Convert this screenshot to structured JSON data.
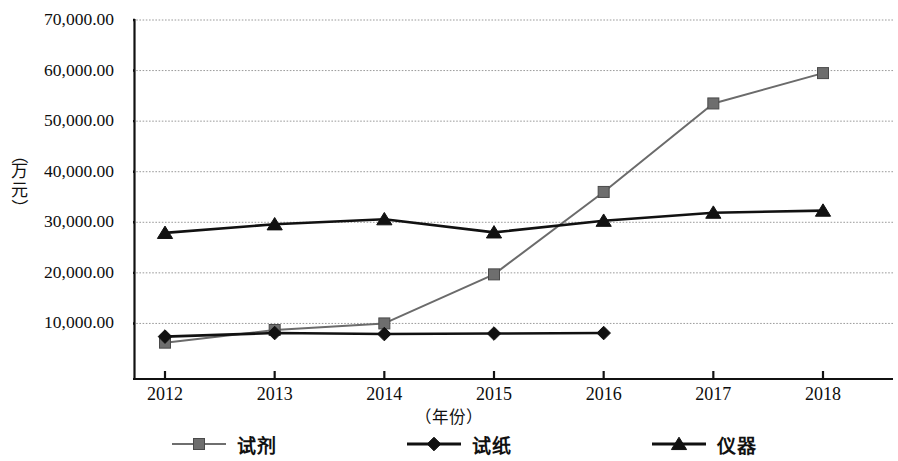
{
  "chart_data": {
    "type": "line",
    "title": "",
    "xlabel": "（年份）",
    "ylabel": "（万元）",
    "x": [
      "2012",
      "2013",
      "2014",
      "2015",
      "2016",
      "2017",
      "2018"
    ],
    "categories": [
      "2012",
      "2013",
      "2014",
      "2015",
      "2016",
      "2017",
      "2018"
    ],
    "ylim": [
      0,
      70000
    ],
    "xlim": [
      "2012",
      "2018"
    ],
    "grid": true,
    "grid_axis": "y",
    "legend_position": "bottom",
    "y_ticks": [
      {
        "value": 70000,
        "label": "70,000.00"
      },
      {
        "value": 60000,
        "label": "60,000.00"
      },
      {
        "value": 50000,
        "label": "50,000.00"
      },
      {
        "value": 40000,
        "label": "40,000.00"
      },
      {
        "value": 30000,
        "label": "30,000.00"
      },
      {
        "value": 20000,
        "label": "20,000.00"
      },
      {
        "value": 10000,
        "label": "10,000.00"
      }
    ],
    "series": [
      {
        "name": "试剂",
        "marker": "square",
        "color": "#6e6e6e",
        "line_color": "#6b6b6b",
        "values": [
          6200,
          8700,
          10000,
          19700,
          36000,
          53500,
          59500
        ]
      },
      {
        "name": "试纸",
        "marker": "diamond",
        "color": "#111111",
        "line_color": "#111111",
        "values": [
          7400,
          8100,
          7900,
          8000,
          8100,
          null,
          null
        ]
      },
      {
        "name": "仪器",
        "marker": "triangle",
        "color": "#111111",
        "line_color": "#111111",
        "values": [
          27900,
          29600,
          30600,
          28000,
          30300,
          31900,
          32300
        ]
      }
    ]
  },
  "axis": {
    "y_unit_chars": [
      "（",
      "万",
      "元",
      "）"
    ]
  },
  "legend": {
    "items": [
      {
        "label": "试剂",
        "marker": "square",
        "color": "#6e6e6e"
      },
      {
        "label": "试纸",
        "marker": "diamond",
        "color": "#111111"
      },
      {
        "label": "仪器",
        "marker": "triangle",
        "color": "#111111"
      }
    ]
  }
}
